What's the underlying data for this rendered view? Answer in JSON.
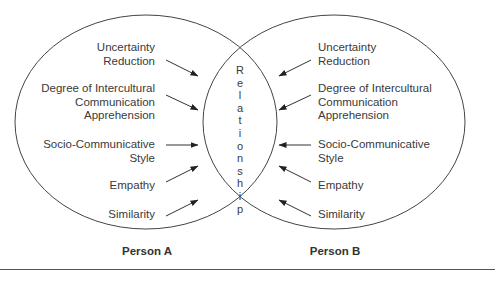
{
  "diagram": {
    "type": "venn",
    "center_label": "Relationship",
    "center_letters": [
      "R",
      "e",
      "l",
      "a",
      "t",
      "i",
      "o",
      "n",
      "s",
      "h",
      "i",
      "p"
    ],
    "person_a": {
      "label": "Person A",
      "factors": [
        {
          "lines": [
            "Uncertainty",
            "Reduction"
          ]
        },
        {
          "lines": [
            "Degree of Intercultural",
            "Communication",
            "Apprehension"
          ]
        },
        {
          "lines": [
            "Socio-Communicative",
            "Style"
          ]
        },
        {
          "lines": [
            "Empathy"
          ]
        },
        {
          "lines": [
            "Similarity"
          ]
        }
      ]
    },
    "person_b": {
      "label": "Person B",
      "factors": [
        {
          "lines": [
            "Uncertainty",
            "Reduction"
          ]
        },
        {
          "lines": [
            "Degree of Intercultural",
            "Communication",
            "Apprehension"
          ]
        },
        {
          "lines": [
            "Socio-Communicative",
            "Style"
          ]
        },
        {
          "lines": [
            "Empathy"
          ]
        },
        {
          "lines": [
            "Similarity"
          ]
        }
      ]
    },
    "colors": {
      "line": "#444444",
      "text": "#3a3a3a"
    }
  }
}
